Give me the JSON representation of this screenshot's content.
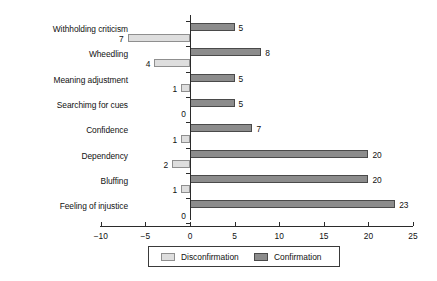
{
  "chart_data": {
    "type": "bar",
    "orientation": "horizontal",
    "title": "",
    "xlabel": "",
    "ylabel": "",
    "xlim": [
      -10,
      25
    ],
    "xticks": [
      -10,
      -5,
      0,
      5,
      10,
      15,
      20,
      25
    ],
    "xtick_labels": [
      "−10",
      "−5",
      "0",
      "5",
      "10",
      "15",
      "20",
      "25"
    ],
    "grid": false,
    "legend_position": "bottom-center",
    "categories": [
      "Withholding criticism",
      "Wheedling",
      "Meaning adjustment",
      "Searchimg for cues",
      "Confidence",
      "Dependency",
      "Bluffing",
      "Feeling of injustice"
    ],
    "series": [
      {
        "name": "Confirmation",
        "color": "#8c8c8c",
        "values": [
          5,
          8,
          5,
          5,
          7,
          20,
          20,
          23
        ],
        "value_labels": [
          "5",
          "8",
          "5",
          "5",
          "7",
          "20",
          "20",
          "23"
        ]
      },
      {
        "name": "Disconfirmation",
        "color": "#dedede",
        "values": [
          -7,
          -4,
          -1,
          0,
          -1,
          -2,
          -1,
          0
        ],
        "value_labels": [
          "7",
          "4",
          "1",
          "0",
          "1",
          "2",
          "1",
          "0"
        ]
      }
    ],
    "legend": [
      {
        "label": "Disconfirmation",
        "color": "#dedede"
      },
      {
        "label": "Confirmation",
        "color": "#8c8c8c"
      }
    ]
  }
}
